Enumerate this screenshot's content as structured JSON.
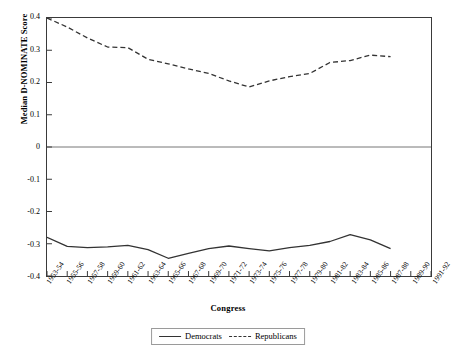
{
  "chart_data": {
    "type": "line",
    "title": "",
    "xlabel": "Congress",
    "ylabel": "Median D-NOMINATE Score",
    "ylim": [
      -0.4,
      0.4
    ],
    "yticks": [
      "0.4",
      "0.3",
      "0.2",
      "0.1",
      "0",
      "-0.1",
      "-0.2",
      "-0.3",
      "-0.4"
    ],
    "ytick_values": [
      0.4,
      0.3,
      0.2,
      0.1,
      0.0,
      -0.1,
      -0.2,
      -0.3,
      -0.4
    ],
    "grid": false,
    "zero_line": true,
    "legend_position": "bottom-center",
    "categories": [
      "1953-54",
      "1955-56",
      "1957-58",
      "1959-60",
      "1961-62",
      "1963-64",
      "1965-66",
      "1967-68",
      "1969-70",
      "1971-72",
      "1973-74",
      "1975-76",
      "1977-78",
      "1979-80",
      "1981-82",
      "1983-84",
      "1985-86",
      "1987-88",
      "1989-90",
      "1991-92"
    ],
    "series": [
      {
        "name": "Democrats",
        "style": "solid",
        "color": "#333333",
        "values": [
          -0.28,
          -0.308,
          -0.312,
          -0.31,
          -0.305,
          -0.318,
          -0.345,
          -0.33,
          -0.315,
          -0.307,
          -0.315,
          -0.322,
          -0.312,
          -0.305,
          -0.293,
          -0.272,
          -0.288,
          -0.315,
          null,
          null
        ]
      },
      {
        "name": "Republicans",
        "style": "dashed",
        "color": "#333333",
        "values": [
          0.4,
          0.372,
          0.338,
          0.31,
          0.308,
          0.272,
          0.258,
          0.242,
          0.228,
          0.205,
          0.186,
          0.205,
          0.218,
          0.228,
          0.262,
          0.268,
          0.285,
          0.28,
          null,
          null
        ]
      }
    ]
  },
  "legend": {
    "democrats_label": "Democrats",
    "republicans_label": "Republicans"
  }
}
